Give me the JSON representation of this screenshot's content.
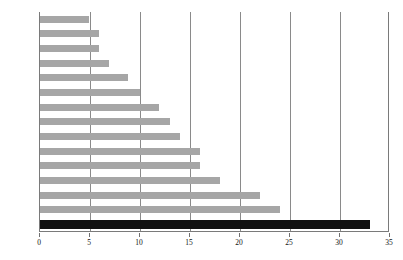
{
  "chart_data": {
    "type": "bar",
    "orientation": "horizontal",
    "title": "",
    "xlabel": "",
    "ylabel": "",
    "xlim": [
      0,
      35
    ],
    "xticks": [
      0,
      5,
      10,
      15,
      20,
      25,
      30,
      35
    ],
    "grid": true,
    "legend": false,
    "categories": [
      "希腊",
      "意大利",
      "西班牙",
      "葡萄牙",
      "卢森堡",
      "芬兰",
      "奥地利",
      "荷兰",
      "法国",
      "丹麦",
      "德国",
      "比利时",
      "爱尔兰",
      "英国",
      "美国"
    ],
    "values": [
      4.9,
      5.9,
      5.9,
      6.9,
      8.8,
      10.0,
      11.9,
      13.0,
      14.0,
      16.0,
      16.0,
      18.0,
      22.0,
      24.0,
      33.0
    ],
    "highlight_index": 14,
    "colors": {
      "bar": "#a6a6a6",
      "bar_highlight": "#111111",
      "axis": "#7a7a7a",
      "gridline": "#8a8a8a",
      "text": "#111111",
      "background": "#ffffff"
    }
  }
}
